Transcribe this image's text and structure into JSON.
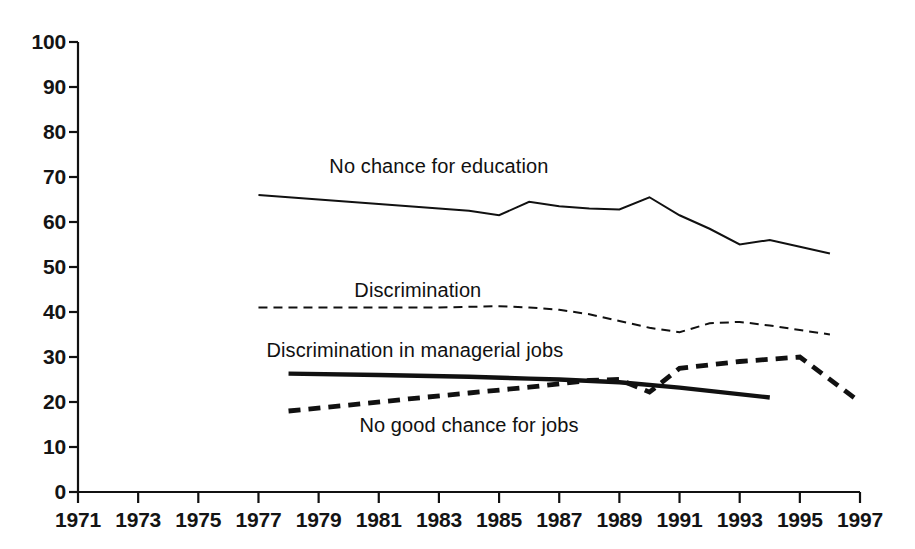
{
  "chart_data": {
    "type": "line",
    "title": "",
    "subtitle": "",
    "xlabel": "",
    "ylabel": "",
    "xlim": [
      1971,
      1997
    ],
    "ylim": [
      0,
      100
    ],
    "grid": false,
    "legend_position": "inline-labels",
    "x_ticks": [
      1971,
      1973,
      1975,
      1977,
      1979,
      1981,
      1983,
      1985,
      1987,
      1989,
      1991,
      1993,
      1995,
      1997
    ],
    "y_ticks": [
      0,
      10,
      20,
      30,
      40,
      50,
      60,
      70,
      80,
      90,
      100
    ],
    "series": [
      {
        "name": "No chance for education",
        "style": "solid-thin",
        "color": "#111111",
        "label_x": 1983.0,
        "label_y": 72.5,
        "x": [
          1977,
          1978,
          1979,
          1980,
          1981,
          1982,
          1983,
          1984,
          1985,
          1986,
          1987,
          1988,
          1989,
          1990,
          1991,
          1992,
          1993,
          1994,
          1995,
          1996
        ],
        "values": [
          66.0,
          65.5,
          65.0,
          64.5,
          64.0,
          63.5,
          63.0,
          62.5,
          61.5,
          64.5,
          63.5,
          63.0,
          62.8,
          65.5,
          61.5,
          58.5,
          55.0,
          56.0,
          54.5,
          53.0
        ]
      },
      {
        "name": "Discrimination",
        "style": "dashed-thin",
        "color": "#111111",
        "label_x": 1982.3,
        "label_y": 45.0,
        "x": [
          1977,
          1979,
          1981,
          1983,
          1985,
          1986,
          1987,
          1988,
          1989,
          1990,
          1991,
          1992,
          1993,
          1994,
          1995,
          1996
        ],
        "values": [
          41.0,
          41.0,
          41.0,
          41.0,
          41.3,
          41.0,
          40.5,
          39.5,
          38.0,
          36.5,
          35.5,
          37.5,
          37.8,
          37.0,
          36.0,
          35.0
        ]
      },
      {
        "name": "Discrimination in managerial jobs",
        "style": "solid-thick",
        "color": "#111111",
        "label_x": 1982.2,
        "label_y": 31.5,
        "x": [
          1978,
          1981,
          1984,
          1986,
          1987,
          1989,
          1991,
          1994
        ],
        "values": [
          26.3,
          26.0,
          25.6,
          25.2,
          25.0,
          24.4,
          23.2,
          21.0
        ]
      },
      {
        "name": "No good chance for jobs",
        "style": "dashed-thick",
        "color": "#111111",
        "label_x": 1984.0,
        "label_y": 15.0,
        "x": [
          1978,
          1980,
          1982,
          1984,
          1986,
          1988,
          1989,
          1990,
          1991,
          1993,
          1995,
          1997
        ],
        "values": [
          18.0,
          19.3,
          20.7,
          22.0,
          23.3,
          24.8,
          25.0,
          22.2,
          27.5,
          29.0,
          30.0,
          20.0
        ]
      }
    ]
  },
  "axes": {
    "y_axis_name": "value-axis",
    "x_axis_name": "year-axis"
  }
}
